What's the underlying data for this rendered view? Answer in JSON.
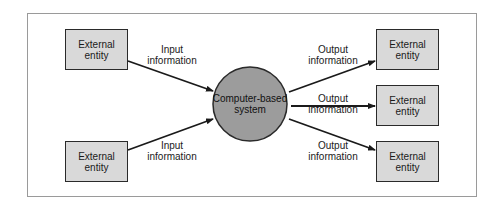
{
  "diagram": {
    "title": "",
    "colors": {
      "entity_fill": "#d9d9d9",
      "entity_border": "#2a2a2a",
      "system_fill": "#9c9c9c",
      "arrow": "#1a1a1a",
      "frame_border": "#9a9a9a"
    },
    "system": {
      "line1": "Computer-based",
      "line2": "system"
    },
    "inputs": [
      {
        "entity_line1": "External",
        "entity_line2": "entity",
        "flow_line1": "Input",
        "flow_line2": "information"
      },
      {
        "entity_line1": "External",
        "entity_line2": "entity",
        "flow_line1": "Input",
        "flow_line2": "information"
      }
    ],
    "outputs": [
      {
        "entity_line1": "External",
        "entity_line2": "entity",
        "flow_line1": "Output",
        "flow_line2": "information"
      },
      {
        "entity_line1": "External",
        "entity_line2": "entity",
        "flow_line1": "Output",
        "flow_line2": "information"
      },
      {
        "entity_line1": "External",
        "entity_line2": "entity",
        "flow_line1": "Output",
        "flow_line2": "information"
      }
    ]
  }
}
